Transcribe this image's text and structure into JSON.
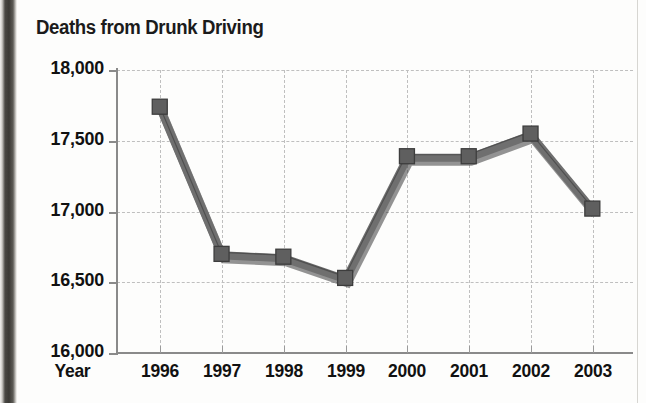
{
  "figure": {
    "title": "Deaths from Drunk Driving",
    "x_axis_name": "Year",
    "line_color": "#6f6f6f",
    "line_edge_color": "#3d3d3d",
    "marker_color": "#5f5f5f",
    "grid_color": "#bfbfbf",
    "axis_color": "#8a8a8a"
  },
  "chart_data": {
    "type": "line",
    "title": "Deaths from Drunk Driving",
    "xlabel": "Year",
    "ylabel": "",
    "categories": [
      "1996",
      "1997",
      "1998",
      "1999",
      "2000",
      "2001",
      "2002",
      "2003"
    ],
    "values": [
      17730,
      16690,
      16670,
      16520,
      17380,
      17380,
      17540,
      17010
    ],
    "ylim": [
      16000,
      18000
    ],
    "ytick_labels": [
      "18,000",
      "17,500",
      "17,000",
      "16,500",
      "16,000"
    ],
    "ytick_values": [
      18000,
      17500,
      17000,
      16500,
      16000
    ],
    "xtick_labels": [
      "1996",
      "1997",
      "1998",
      "1999",
      "2000",
      "2001",
      "2002",
      "2003"
    ],
    "grid": true,
    "grid_style": "dashed",
    "legend": false,
    "series": [
      {
        "name": "Deaths from Drunk Driving",
        "values": [
          17730,
          16690,
          16670,
          16520,
          17380,
          17380,
          17540,
          17010
        ]
      }
    ]
  }
}
